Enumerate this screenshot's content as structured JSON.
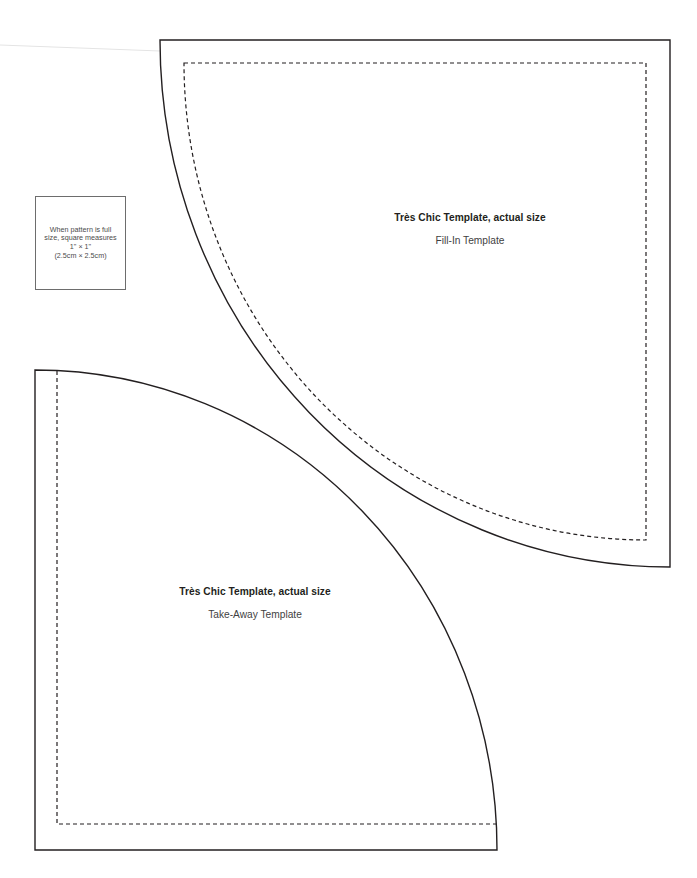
{
  "scale_note": {
    "lines": [
      "When pattern is full",
      "size, square measures",
      "1\" × 1\"",
      "(2.5cm × 2.5cm)"
    ]
  },
  "templates": [
    {
      "id": "fill-in",
      "title": "Très Chic Template, actual size",
      "subtitle": "Fill-In Template"
    },
    {
      "id": "take-away",
      "title": "Très Chic Template, actual size",
      "subtitle": "Take-Away Template"
    }
  ],
  "colors": {
    "outline": "#231f20",
    "dashed": "#231f20",
    "box_border": "#6d6d6d",
    "background": "#ffffff"
  }
}
